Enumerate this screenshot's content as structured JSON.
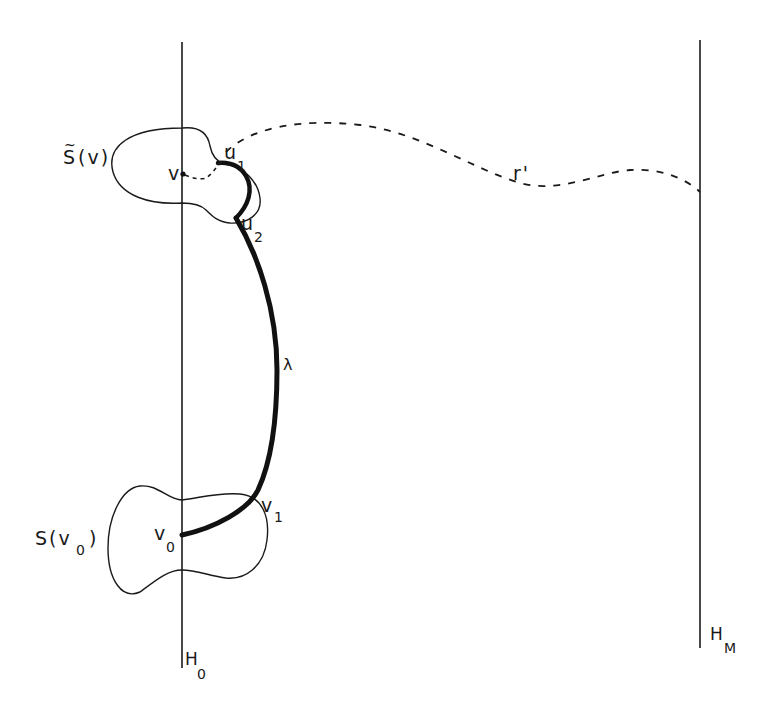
{
  "figure": {
    "type": "topological-diagram",
    "background": "#ffffff",
    "ink": "#1a1a1a"
  },
  "labels": {
    "s_tilde_v": {
      "main": "S",
      "tilde": "~",
      "rest": "(v)"
    },
    "v": {
      "main": "v"
    },
    "u1": {
      "main": "u",
      "sub": "1"
    },
    "u2": {
      "main": "u",
      "sub": "2"
    },
    "r_prime": {
      "main": "r'"
    },
    "lambda": {
      "main": "λ"
    },
    "s_v0": {
      "main": "S(v",
      "sub": "0",
      "close": ")"
    },
    "v0": {
      "main": "v",
      "sub": "0"
    },
    "v1": {
      "main": "v",
      "sub": "1"
    },
    "h0": {
      "main": "H",
      "sub": "0"
    },
    "hm": {
      "main": "H",
      "sub": "M"
    }
  },
  "lines": {
    "h0_line": {
      "x": 182,
      "y1": 42,
      "y2": 668
    },
    "hm_line": {
      "x": 700,
      "y1": 40,
      "y2": 648
    }
  }
}
